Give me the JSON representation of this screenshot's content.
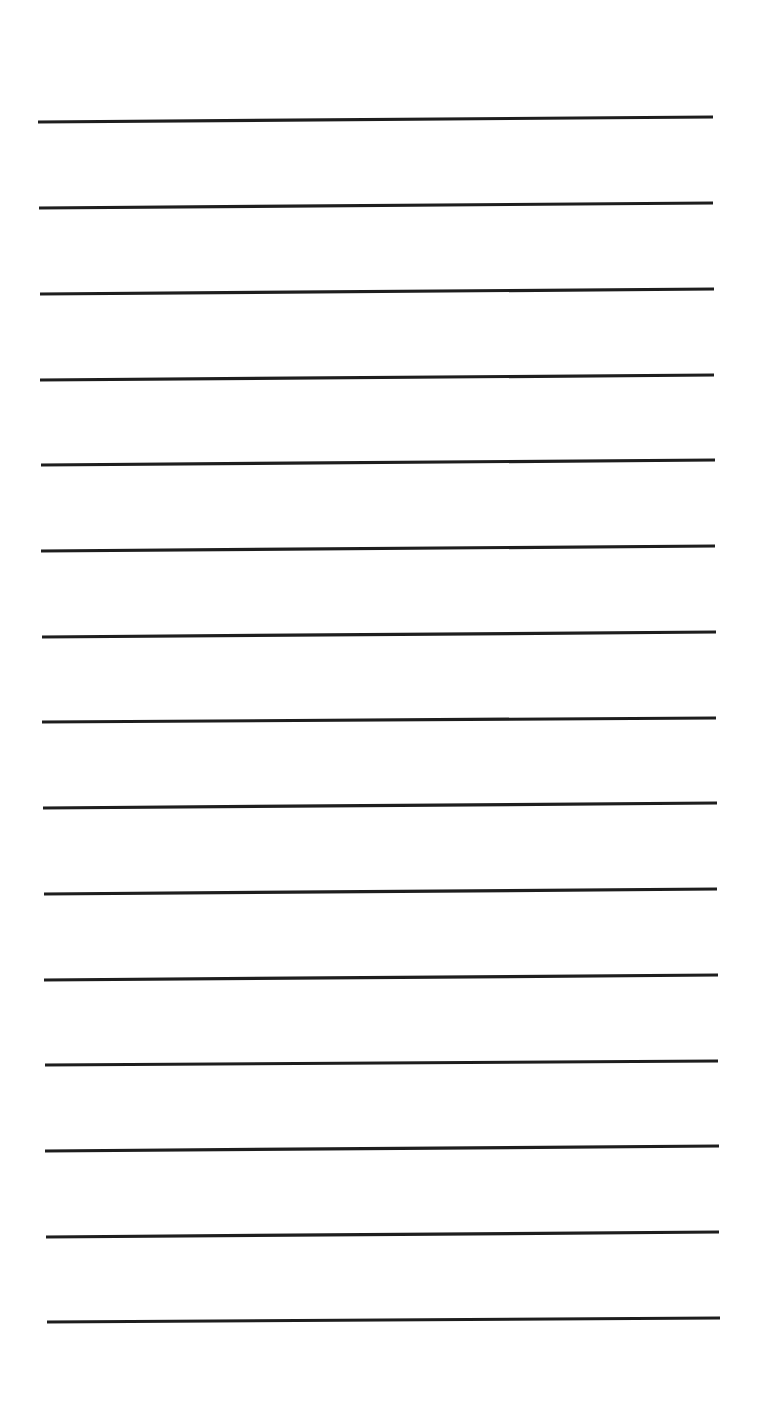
{
  "page": {
    "type": "lined-paper",
    "background_color": "#ffffff",
    "line_color": "#1e1e1e",
    "line_count": 15,
    "lines": [
      {
        "x1": 38,
        "y1": 122,
        "x2": 713,
        "y2": 117
      },
      {
        "x1": 39,
        "y1": 208,
        "x2": 713,
        "y2": 203
      },
      {
        "x1": 40,
        "y1": 294,
        "x2": 714,
        "y2": 289
      },
      {
        "x1": 40,
        "y1": 380,
        "x2": 714,
        "y2": 375
      },
      {
        "x1": 41,
        "y1": 465,
        "x2": 715,
        "y2": 460
      },
      {
        "x1": 41,
        "y1": 551,
        "x2": 715,
        "y2": 546
      },
      {
        "x1": 42,
        "y1": 637,
        "x2": 716,
        "y2": 632
      },
      {
        "x1": 42,
        "y1": 722,
        "x2": 716,
        "y2": 718
      },
      {
        "x1": 43,
        "y1": 808,
        "x2": 717,
        "y2": 803
      },
      {
        "x1": 44,
        "y1": 894,
        "x2": 717,
        "y2": 889
      },
      {
        "x1": 44,
        "y1": 980,
        "x2": 718,
        "y2": 975
      },
      {
        "x1": 45,
        "y1": 1065,
        "x2": 718,
        "y2": 1061
      },
      {
        "x1": 45,
        "y1": 1151,
        "x2": 719,
        "y2": 1146
      },
      {
        "x1": 46,
        "y1": 1237,
        "x2": 719,
        "y2": 1232
      },
      {
        "x1": 47,
        "y1": 1322,
        "x2": 720,
        "y2": 1318
      }
    ]
  }
}
